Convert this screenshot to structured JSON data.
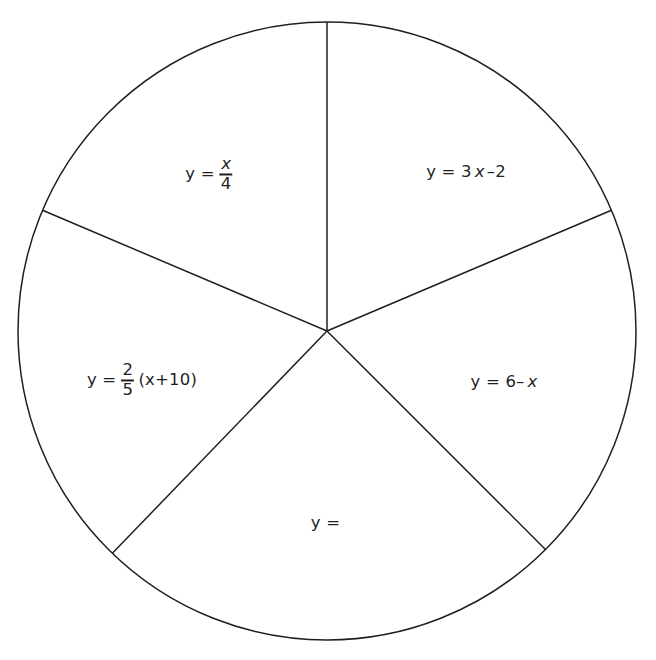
{
  "figure": {
    "type": "sector-wheel-diagram",
    "background_color": "#ffffff",
    "stroke_color": "#1f1f1f",
    "stroke_width": 1.5,
    "circle": {
      "cx": 327,
      "cy": 331,
      "r": 309
    },
    "spoke_angles_deg": [
      90,
      23,
      315,
      226,
      157
    ],
    "sectors": [
      {
        "name": "sector-top-right",
        "label_text": "y = 3x–2",
        "label_x": 466,
        "label_y": 172,
        "parts": {
          "lhs": "y = 3",
          "var": "x",
          "tail": "–2"
        }
      },
      {
        "name": "sector-right",
        "label_text": "y = 6–x",
        "label_x": 504,
        "label_y": 382,
        "parts": {
          "lhs": "y = 6–",
          "var": "x",
          "tail": ""
        }
      },
      {
        "name": "sector-bottom",
        "label_text": "y =",
        "label_x": 327,
        "label_y": 523,
        "parts": {
          "lhs": "y =",
          "var": "",
          "tail": ""
        }
      },
      {
        "name": "sector-left",
        "label_text": "y = 2/5(x+10)",
        "label_x": 142,
        "label_y": 381,
        "parts": {
          "lhs": "y =",
          "numerator": "2",
          "denominator": "5",
          "tail": "(x+10)"
        }
      },
      {
        "name": "sector-top-left",
        "label_text": "y = x/4",
        "label_x": 210,
        "label_y": 175,
        "parts": {
          "lhs": "y =",
          "numerator": "x",
          "denominator": "4",
          "tail": ""
        }
      }
    ]
  },
  "chart_data": {
    "type": "pie",
    "title": "",
    "xlabel": "",
    "ylabel": "",
    "legend_position": "none",
    "grid": false,
    "categories": [
      "y = 3x–2",
      "y = 6–x",
      "y =",
      "y = 2/5(x+10)",
      "y = x/4"
    ],
    "values": [
      67,
      68,
      89,
      69,
      67
    ],
    "units": "degrees",
    "boundary_angles_deg": [
      90,
      23,
      315,
      226,
      157
    ],
    "annotations": [
      "y = 3x–2",
      "y = 6–x",
      "y =",
      "y = 2/5(x+10)",
      "y = x/4"
    ]
  }
}
